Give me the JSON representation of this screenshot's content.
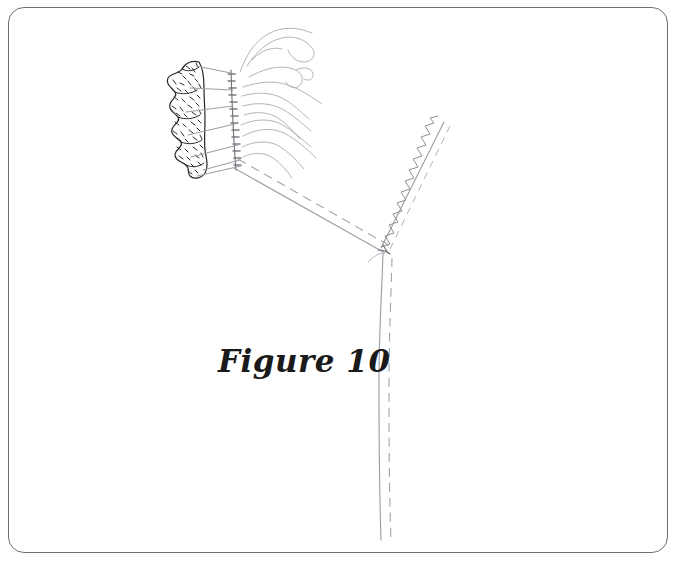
{
  "figure": {
    "caption": "Figure 10",
    "frame": {
      "border_color": "#6e7074",
      "corner_radius_px": 16,
      "background": "#ffffff"
    },
    "line_color": "#9ea0a6",
    "dark_line_color": "#4a4c50"
  },
  "illustration": {
    "parts": [
      {
        "name": "lace-trim-edge",
        "description": "scalloped stippled lace ruffle along left edge of gathered panel",
        "scallop_count": 7
      },
      {
        "name": "gathering-stitch-column",
        "description": "vertical column of short tick marks marking the gathering line",
        "tick_count": 14
      },
      {
        "name": "gather-fold-lines",
        "description": "wavy fold lines radiating right from the gathered edge",
        "fold_count": 9
      },
      {
        "name": "shoulder-seam-line",
        "description": "long diagonal seam line from neckline to underarm point"
      },
      {
        "name": "shoulder-seam-stitch-dash",
        "description": "dashed stitching line parallel to the shoulder seam"
      },
      {
        "name": "zigzag-overlock-seam",
        "description": "zigzag / serged stitch running up the right sleeve seam",
        "zigzag_count": 18
      },
      {
        "name": "zigzag-seam-dash",
        "description": "dashed cutting line parallel to the zigzag overlock seam"
      },
      {
        "name": "side-seam-line",
        "description": "solid side seam curving down from underarm to hem"
      },
      {
        "name": "side-seam-stitch-dash",
        "description": "dashed stitch line parallel to the side seam"
      },
      {
        "name": "underarm-junction",
        "description": "point where shoulder seam, zigzag seam and side seam meet"
      }
    ]
  }
}
